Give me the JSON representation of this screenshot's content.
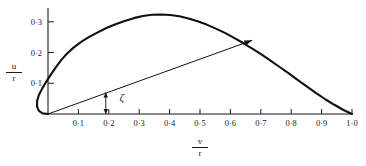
{
  "figure": {
    "title": "",
    "angle_symbol": "ζ"
  },
  "axes": {
    "x": {
      "label_numerator": "v",
      "label_denominator": "r",
      "ticks": [
        "0·1",
        "0·2",
        "0·3",
        "0·4",
        "0·5",
        "0·6",
        "0·7",
        "0·8",
        "0·9",
        "1·0"
      ]
    },
    "y": {
      "label_numerator": "u",
      "label_denominator": "r",
      "ticks": [
        "0·1",
        "0·2",
        "0·3"
      ]
    }
  },
  "chart_data": {
    "type": "line",
    "title": "",
    "xlabel": "v/r",
    "ylabel": "u/r",
    "xlim": [
      -0.06,
      1.04
    ],
    "ylim": [
      -0.01,
      0.375
    ],
    "grid": false,
    "legend": null,
    "xticks": [
      0.1,
      0.2,
      0.3,
      0.4,
      0.5,
      0.6,
      0.7,
      0.8,
      0.9,
      1.0
    ],
    "xticklabels": [
      "0·1",
      "0·2",
      "0·3",
      "0·4",
      "0·5",
      "0·6",
      "0·7",
      "0·8",
      "0·9",
      "1·0"
    ],
    "yticks": [
      0.1,
      0.2,
      0.3
    ],
    "yticklabels": [
      "0·1",
      "0·2",
      "0·3"
    ],
    "series": [
      {
        "name": "hodograph-curve",
        "type": "line",
        "color": "#111111",
        "linewidth": 2.0,
        "points": [
          [
            0.0,
            0.0
          ],
          [
            -0.018,
            0.002
          ],
          [
            -0.03,
            0.01
          ],
          [
            -0.036,
            0.024
          ],
          [
            -0.036,
            0.042
          ],
          [
            -0.03,
            0.062
          ],
          [
            -0.018,
            0.085
          ],
          [
            -0.004,
            0.108
          ],
          [
            0.012,
            0.132
          ],
          [
            0.028,
            0.155
          ],
          [
            0.044,
            0.176
          ],
          [
            0.062,
            0.196
          ],
          [
            0.084,
            0.216
          ],
          [
            0.108,
            0.234
          ],
          [
            0.134,
            0.25
          ],
          [
            0.162,
            0.265
          ],
          [
            0.192,
            0.28
          ],
          [
            0.222,
            0.292
          ],
          [
            0.252,
            0.303
          ],
          [
            0.282,
            0.312
          ],
          [
            0.312,
            0.319
          ],
          [
            0.342,
            0.323
          ],
          [
            0.372,
            0.324
          ],
          [
            0.402,
            0.322
          ],
          [
            0.432,
            0.318
          ],
          [
            0.462,
            0.311
          ],
          [
            0.492,
            0.302
          ],
          [
            0.522,
            0.291
          ],
          [
            0.552,
            0.278
          ],
          [
            0.582,
            0.264
          ],
          [
            0.612,
            0.248
          ],
          [
            0.642,
            0.231
          ],
          [
            0.672,
            0.213
          ],
          [
            0.702,
            0.194
          ],
          [
            0.732,
            0.174
          ],
          [
            0.762,
            0.153
          ],
          [
            0.792,
            0.132
          ],
          [
            0.822,
            0.11
          ],
          [
            0.852,
            0.089
          ],
          [
            0.882,
            0.068
          ],
          [
            0.912,
            0.048
          ],
          [
            0.942,
            0.03
          ],
          [
            0.972,
            0.013
          ],
          [
            1.0,
            0.0
          ]
        ]
      },
      {
        "name": "resultant-vector",
        "type": "arrow",
        "color": "#111111",
        "linewidth": 1.0,
        "from": [
          0.0,
          0.0
        ],
        "to": [
          0.672,
          0.24
        ]
      },
      {
        "name": "angle-indicator",
        "type": "double-arrow",
        "color": "#111111",
        "at_x": 0.19,
        "from_y": 0.0,
        "to_y": 0.07
      }
    ],
    "annotations": [
      {
        "text": "ζ",
        "x": 0.235,
        "y": 0.05,
        "name": "zeta-angle-label"
      }
    ]
  }
}
